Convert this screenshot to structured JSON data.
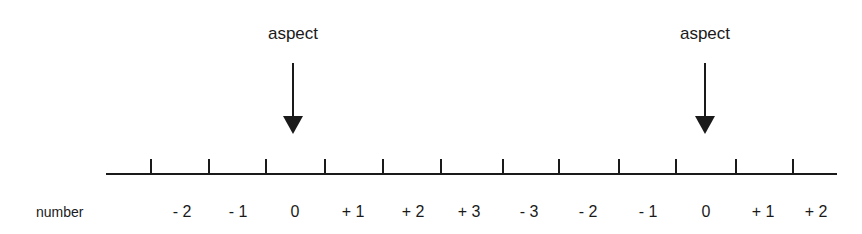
{
  "diagram": {
    "row_label": "number",
    "arrows": [
      {
        "label": "aspect",
        "x": 293
      },
      {
        "label": "aspect",
        "x": 705
      }
    ],
    "ticks": [
      151,
      209,
      266,
      325,
      383,
      441,
      503,
      559,
      619,
      676,
      736,
      793
    ],
    "numbers": [
      {
        "text": "- 2",
        "x": 182
      },
      {
        "text": "- 1",
        "x": 238
      },
      {
        "text": "0",
        "x": 295
      },
      {
        "text": "+ 1",
        "x": 353
      },
      {
        "text": "+ 2",
        "x": 413
      },
      {
        "text": "+ 3",
        "x": 469
      },
      {
        "text": "- 3",
        "x": 529
      },
      {
        "text": "- 2",
        "x": 588
      },
      {
        "text": "- 1",
        "x": 648
      },
      {
        "text": "0",
        "x": 706
      },
      {
        "text": "+ 1",
        "x": 763
      },
      {
        "text": "+ 2",
        "x": 816
      }
    ]
  }
}
